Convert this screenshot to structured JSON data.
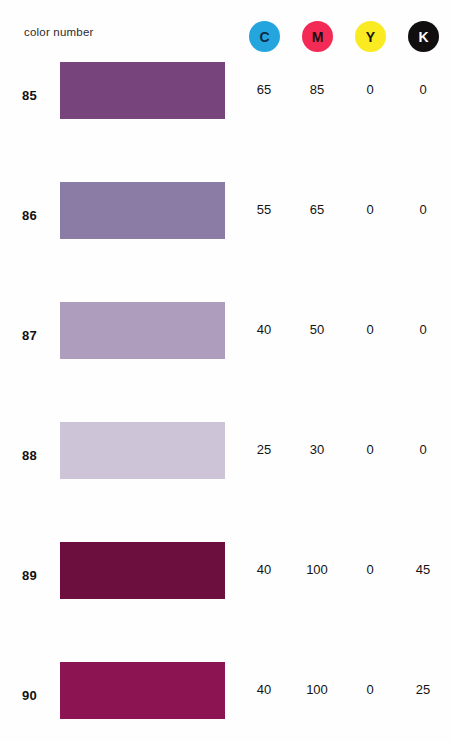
{
  "header": {
    "title": "color number",
    "inks": [
      {
        "key": "C",
        "label": "C",
        "name": "cyan",
        "circle_color": "#24A5DE",
        "text_color": "#0d2b45"
      },
      {
        "key": "M",
        "label": "M",
        "name": "magenta",
        "circle_color": "#F42A56",
        "text_color": "#1a0a10"
      },
      {
        "key": "Y",
        "label": "Y",
        "name": "yellow",
        "circle_color": "#FAEA22",
        "text_color": "#171500"
      },
      {
        "key": "K",
        "label": "K",
        "name": "black",
        "circle_color": "#100E0E",
        "text_color": "#ffffff"
      }
    ]
  },
  "chart_data": {
    "type": "table",
    "title": "color number",
    "columns": [
      "color number",
      "swatch",
      "C",
      "M",
      "Y",
      "K"
    ],
    "rows": [
      {
        "number": "85",
        "swatch_color": "#77457C",
        "c": "65",
        "m": "85",
        "y": "0",
        "k": "0"
      },
      {
        "number": "86",
        "swatch_color": "#8B7CA6",
        "c": "55",
        "m": "65",
        "y": "0",
        "k": "0"
      },
      {
        "number": "87",
        "swatch_color": "#AE9DBC",
        "c": "40",
        "m": "50",
        "y": "0",
        "k": "0"
      },
      {
        "number": "88",
        "swatch_color": "#CDC4D8",
        "c": "25",
        "m": "30",
        "y": "0",
        "k": "0"
      },
      {
        "number": "89",
        "swatch_color": "#6C0E3E",
        "c": "40",
        "m": "100",
        "y": "0",
        "k": "45"
      },
      {
        "number": "90",
        "swatch_color": "#8C1453",
        "c": "40",
        "m": "100",
        "y": "0",
        "k": "25"
      }
    ]
  }
}
